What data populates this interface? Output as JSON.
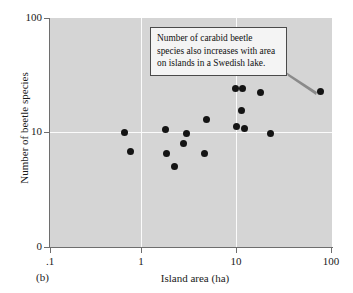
{
  "figure": {
    "panel_label": "(b)",
    "background_color": "#ffffff",
    "plot_fill_color": "#d5d5d5",
    "gridline_color": "#fbfbfb",
    "point_color": "#141414",
    "axis_color": "#6e6e6e"
  },
  "callout": {
    "lines": [
      "Number of carabid beetle",
      "species also increases with area",
      "on islands in a Swedish lake."
    ],
    "text": "Number of carabid beetle species also increases with area on islands in a Swedish lake.",
    "border_color": "#4a4a4a",
    "fill_color": "#f4f4f4"
  },
  "chart_data": {
    "type": "scatter",
    "title": "",
    "xlabel": "Island area (ha)",
    "ylabel": "Number of beetle species",
    "xscale": "log",
    "yscale": "log",
    "xlim": [
      0.1,
      100
    ],
    "ylim": [
      1,
      100
    ],
    "xticks": [
      0.1,
      1,
      10,
      100
    ],
    "xtick_labels": [
      ".1",
      "1",
      "10",
      "100"
    ],
    "yticks": [
      10,
      100
    ],
    "ytick_labels": [
      "10",
      "100"
    ],
    "y_origin_label": "0",
    "grid": true,
    "gridlines_x": [
      1,
      10
    ],
    "gridlines_y": [
      10
    ],
    "legend": null,
    "annotation": "Number of carabid beetle species also increases with area on islands in a Swedish lake.",
    "annotation_target_point": [
      75,
      24
    ],
    "points": [
      {
        "x": 0.62,
        "y": 10.0
      },
      {
        "x": 0.72,
        "y": 6.8
      },
      {
        "x": 1.7,
        "y": 10.7
      },
      {
        "x": 1.75,
        "y": 6.6
      },
      {
        "x": 2.1,
        "y": 5.0
      },
      {
        "x": 2.6,
        "y": 8.0
      },
      {
        "x": 2.85,
        "y": 9.8
      },
      {
        "x": 4.4,
        "y": 6.6
      },
      {
        "x": 4.6,
        "y": 13.0
      },
      {
        "x": 9.3,
        "y": 24.0
      },
      {
        "x": 9.6,
        "y": 11.2
      },
      {
        "x": 11.3,
        "y": 24.0
      },
      {
        "x": 11.0,
        "y": 15.5
      },
      {
        "x": 11.6,
        "y": 10.8
      },
      {
        "x": 17.5,
        "y": 22.5
      },
      {
        "x": 22.0,
        "y": 9.9
      },
      {
        "x": 75.0,
        "y": 23.0
      }
    ]
  }
}
